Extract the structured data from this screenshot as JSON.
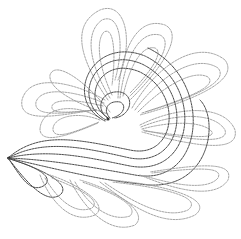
{
  "image": {
    "description": "Quilting stitch pattern: feather plume with central spiral swirl",
    "background": "#ffffff",
    "stroke_light": "#9a9a9a",
    "stroke_dark": "#4a4a4a",
    "width": 241,
    "height": 239
  }
}
